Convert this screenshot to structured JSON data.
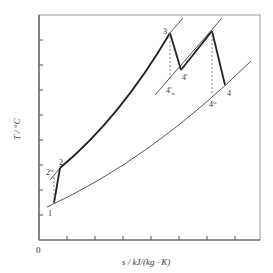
{
  "figure": {
    "type": "T-s diagram (reheat gas turbine cycle)",
    "axes": {
      "xlabel": "s / kJ/(kg · K)",
      "ylabel": "T / °C",
      "origin_label": "0",
      "x_ticks": 8,
      "y_ticks": 8
    },
    "points": {
      "p1": "1",
      "p2": "2",
      "p2is": "2",
      "p2is_sup": "is",
      "p3": "3",
      "p4prime": "4'",
      "p4prime_is": "4'",
      "p4prime_is_sub": "is",
      "p4": "4",
      "p4is": "4",
      "p4is_sup": "is"
    },
    "colors": {
      "frame": "#888888",
      "process_line": "#222222",
      "isobar": "#444444",
      "dashed": "#777777"
    }
  }
}
